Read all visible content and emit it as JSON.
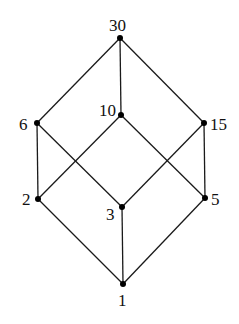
{
  "diagram": {
    "type": "hasse-diagram",
    "title": "",
    "colors": {
      "line": "#1a1a1a",
      "node": "#000000",
      "text": "#111111",
      "background": "#ffffff"
    },
    "nodes": [
      {
        "id": "30",
        "label": "30",
        "x": 120,
        "y": 38,
        "lx": 109,
        "ly": 31,
        "anchor": "start"
      },
      {
        "id": "10",
        "label": "10",
        "x": 121,
        "y": 115,
        "lx": 99,
        "ly": 116,
        "anchor": "start"
      },
      {
        "id": "6",
        "label": "6",
        "x": 37,
        "y": 123,
        "lx": 19,
        "ly": 130,
        "anchor": "start"
      },
      {
        "id": "15",
        "label": "15",
        "x": 204,
        "y": 123,
        "lx": 210,
        "ly": 130,
        "anchor": "start"
      },
      {
        "id": "2",
        "label": "2",
        "x": 38,
        "y": 199,
        "lx": 22,
        "ly": 205,
        "anchor": "start"
      },
      {
        "id": "3",
        "label": "3",
        "x": 122,
        "y": 207,
        "lx": 106,
        "ly": 220,
        "anchor": "start"
      },
      {
        "id": "5",
        "label": "5",
        "x": 205,
        "y": 198,
        "lx": 211,
        "ly": 205,
        "anchor": "start"
      },
      {
        "id": "1",
        "label": "1",
        "x": 123,
        "y": 284,
        "lx": 118,
        "ly": 306,
        "anchor": "start"
      }
    ],
    "edges": [
      [
        "30",
        "6"
      ],
      [
        "30",
        "10"
      ],
      [
        "30",
        "15"
      ],
      [
        "6",
        "2"
      ],
      [
        "6",
        "3"
      ],
      [
        "10",
        "2"
      ],
      [
        "10",
        "5"
      ],
      [
        "15",
        "3"
      ],
      [
        "15",
        "5"
      ],
      [
        "2",
        "1"
      ],
      [
        "3",
        "1"
      ],
      [
        "5",
        "1"
      ]
    ]
  }
}
